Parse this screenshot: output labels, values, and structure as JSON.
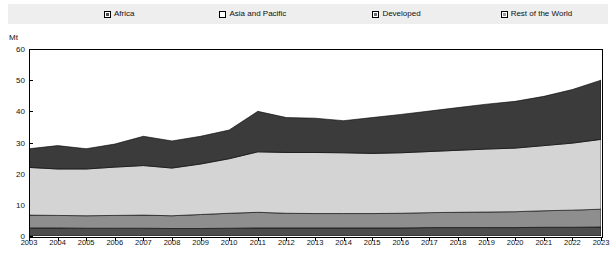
{
  "legend": {
    "position": "top",
    "items": [
      {
        "label": "Africa",
        "swatch": "swatch-dark-gray",
        "color": "#4d4d4d"
      },
      {
        "label": "Asia and Pacific",
        "swatch": "swatch-white",
        "color": "#d4d4d4"
      },
      {
        "label": "Developed",
        "swatch": "swatch-mid-gray",
        "color": "#3b3b3b"
      },
      {
        "label": "Rest of the World",
        "swatch": "swatch-light-gray",
        "color": "#8e8e8e"
      }
    ]
  },
  "axes": {
    "y_unit": "Mt",
    "y_ticks": [
      "0",
      "10",
      "20",
      "30",
      "40",
      "50",
      "60"
    ],
    "x_ticks": [
      "2003",
      "2004",
      "2005",
      "2006",
      "2007",
      "2008",
      "2009",
      "2010",
      "2011",
      "2012",
      "2013",
      "2014",
      "2015",
      "2016",
      "2017",
      "2018",
      "2019",
      "2020",
      "2021",
      "2022",
      "2023"
    ]
  },
  "chart_data": {
    "type": "area",
    "stacked": true,
    "title": "",
    "xlabel": "",
    "ylabel": "Mt",
    "ylim": [
      0,
      60
    ],
    "xlim": [
      2003,
      2023
    ],
    "grid": false,
    "legend_position": "top",
    "x": [
      2003,
      2004,
      2005,
      2006,
      2007,
      2008,
      2009,
      2010,
      2011,
      2012,
      2013,
      2014,
      2015,
      2016,
      2017,
      2018,
      2019,
      2020,
      2021,
      2022,
      2023
    ],
    "series": [
      {
        "name": "Africa",
        "color": "#4d4d4d",
        "values": [
          2.6,
          2.6,
          2.5,
          2.5,
          2.5,
          2.4,
          2.4,
          2.5,
          2.6,
          2.6,
          2.6,
          2.6,
          2.6,
          2.6,
          2.7,
          2.7,
          2.7,
          2.7,
          2.8,
          2.8,
          2.9
        ]
      },
      {
        "name": "Rest of the World",
        "color": "#8e8e8e",
        "values": [
          4.1,
          4.0,
          4.0,
          4.1,
          4.2,
          4.1,
          4.5,
          4.8,
          5.0,
          4.7,
          4.6,
          4.6,
          4.6,
          4.7,
          4.8,
          4.9,
          5.0,
          5.1,
          5.3,
          5.5,
          5.7
        ]
      },
      {
        "name": "Asia and Pacific",
        "color": "#d4d4d4",
        "values": [
          15.3,
          14.9,
          15.0,
          15.5,
          15.9,
          15.3,
          16.2,
          17.5,
          19.4,
          19.5,
          19.6,
          19.5,
          19.3,
          19.4,
          19.6,
          19.9,
          20.2,
          20.4,
          20.9,
          21.5,
          22.4
        ]
      },
      {
        "name": "Developed",
        "color": "#3b3b3b",
        "values": [
          6.0,
          7.5,
          6.5,
          7.4,
          9.4,
          8.7,
          8.9,
          9.2,
          13.0,
          11.2,
          11.0,
          10.3,
          11.5,
          12.3,
          13.0,
          13.7,
          14.4,
          15.0,
          15.8,
          17.2,
          19.0
        ]
      }
    ],
    "totals": [
      28.0,
      29.0,
      28.0,
      29.5,
      32.0,
      30.5,
      32.0,
      34.0,
      40.0,
      38.0,
      37.8,
      37.0,
      38.0,
      39.0,
      40.1,
      41.2,
      42.3,
      43.2,
      44.8,
      47.0,
      50.0
    ]
  }
}
